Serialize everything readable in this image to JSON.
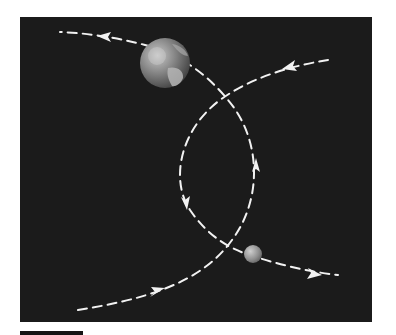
{
  "figure": {
    "colors": {
      "page_background": "#ffffff",
      "panel_background": "#1b1b1b",
      "path_color": "#f2f2f2",
      "label_bar": "#141414"
    },
    "bodies": [
      {
        "name": "earth",
        "cx": 165,
        "cy": 63,
        "r": 25
      },
      {
        "name": "small-body",
        "cx": 253,
        "cy": 254,
        "r": 9
      }
    ],
    "paths": [
      {
        "name": "earth-trajectory",
        "direction": "bottom-left to top-left via right loop"
      },
      {
        "name": "small-body-trajectory",
        "direction": "top-right to bottom-right via left loop"
      }
    ],
    "arrows": [
      {
        "name": "arrow-top-left",
        "x": 105,
        "y": 37,
        "points": "left"
      },
      {
        "name": "arrow-top-right",
        "x": 290,
        "y": 66,
        "points": "left"
      },
      {
        "name": "arrow-right-loop",
        "x": 256,
        "y": 168,
        "points": "up"
      },
      {
        "name": "arrow-left-loop",
        "x": 185,
        "y": 202,
        "points": "down"
      },
      {
        "name": "arrow-bottom-left",
        "x": 157,
        "y": 292,
        "points": "right"
      },
      {
        "name": "arrow-bottom-right",
        "x": 312,
        "y": 273,
        "points": "right"
      }
    ]
  }
}
